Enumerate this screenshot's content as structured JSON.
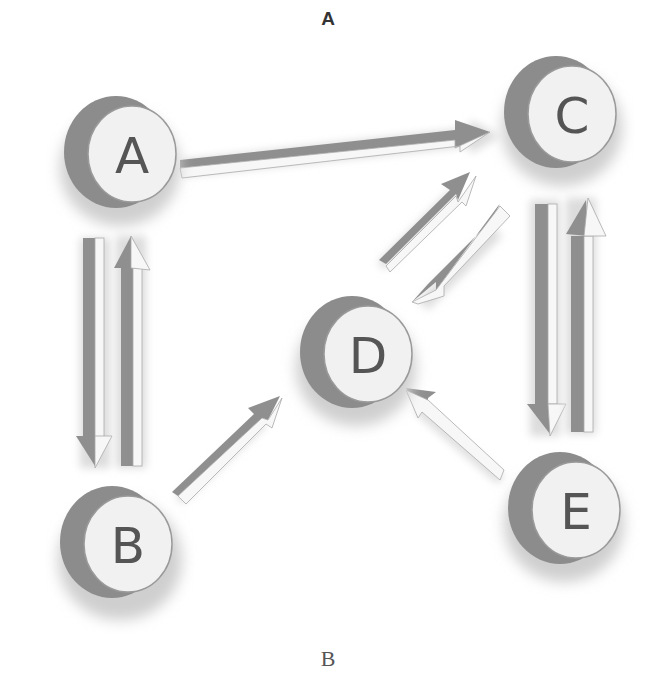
{
  "captions": {
    "top": "A",
    "bottom": "B"
  },
  "colors": {
    "node_face": "#f1f1f1",
    "node_side": "#8c8c8c",
    "node_outline": "#9a9a9a",
    "node_text": "#555555",
    "arrow_dark": "#8f8f8f",
    "arrow_light": "#f7f7f7",
    "shadow": "#d9d9d9",
    "background": "#ffffff"
  },
  "diagram": {
    "nodes": [
      {
        "id": "A",
        "label": "A",
        "cx": 128,
        "cy": 152
      },
      {
        "id": "C",
        "label": "C",
        "cx": 566,
        "cy": 111
      },
      {
        "id": "D",
        "label": "D",
        "cx": 361,
        "cy": 352
      },
      {
        "id": "B",
        "label": "B",
        "cx": 123,
        "cy": 540
      },
      {
        "id": "E",
        "label": "E",
        "cx": 569,
        "cy": 508
      }
    ],
    "edges": [
      {
        "from": "A",
        "to": "C"
      },
      {
        "from": "A",
        "to": "B"
      },
      {
        "from": "B",
        "to": "A"
      },
      {
        "from": "C",
        "to": "E"
      },
      {
        "from": "E",
        "to": "C"
      },
      {
        "from": "D",
        "to": "C"
      },
      {
        "from": "C",
        "to": "D"
      },
      {
        "from": "B",
        "to": "D"
      },
      {
        "from": "E",
        "to": "D"
      }
    ]
  }
}
